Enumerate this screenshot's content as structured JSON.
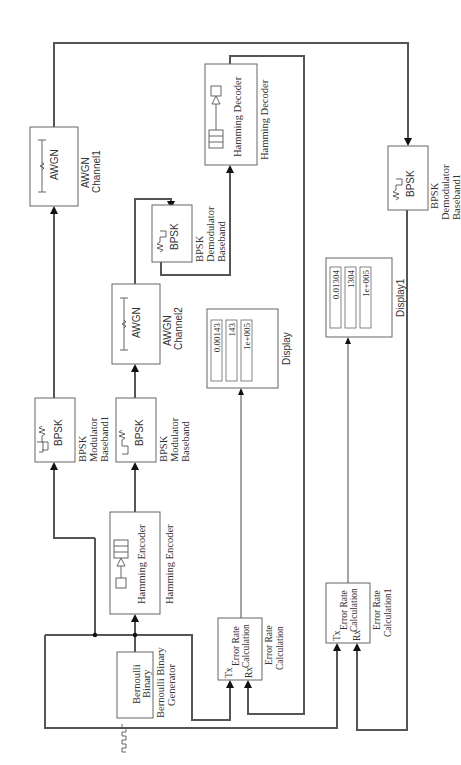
{
  "diagram": {
    "orientation": "rotated-90-ccw",
    "blocks": {
      "bernoulli": {
        "icon_text": "Bernoulli\nBinary",
        "icon_line1": "Bernoulli",
        "icon_line2": "Binary",
        "caption_line1": "Bernoulli Binary",
        "caption_line2": "Generator"
      },
      "hamming_encoder": {
        "icon_text": "Hamming Encoder",
        "caption": "Hamming Encoder"
      },
      "bpsk_mod": {
        "icon_text": "BPSK",
        "caption_line1": "BPSK",
        "caption_line2": "Modulator",
        "caption_line3": "Baseband"
      },
      "bpsk_mod1": {
        "icon_text": "BPSK",
        "caption_line1": "BPSK",
        "caption_line2": "Modulator",
        "caption_line3": "Baseband1"
      },
      "awgn_ch1": {
        "icon_text": "AWGN",
        "caption_line1": "AWGN",
        "caption_line2": "Channel1"
      },
      "awgn_ch2": {
        "icon_text": "AWGN",
        "caption_line1": "AWGN",
        "caption_line2": "Channel2"
      },
      "bpsk_demod": {
        "icon_text": "BPSK",
        "caption_line1": "BPSK",
        "caption_line2": "Demodulator",
        "caption_line3": "Baseband"
      },
      "bpsk_demod1": {
        "icon_text": "BPSK",
        "caption_line1": "BPSK",
        "caption_line2": "Demodulator",
        "caption_line3": "Baseband1"
      },
      "hamming_decoder": {
        "icon_text": "Hamming Decoder",
        "caption": "Hamming Decoder"
      },
      "error_rate": {
        "port_tx": "Tx",
        "port_rx": "Rx",
        "icon_line1": "Error Rate",
        "icon_line2": "Calculation",
        "caption_line1": "Error Rate",
        "caption_line2": "Calculation"
      },
      "error_rate1": {
        "port_tx": "Tx",
        "port_rx": "Rx",
        "icon_line1": "Error Rate",
        "icon_line2": "Calculation",
        "caption_line1": "Error Rate",
        "caption_line2": "Calculation1"
      },
      "display": {
        "values": [
          "0.00143",
          "143",
          "1e+005"
        ],
        "caption": "Display"
      },
      "display1": {
        "values": [
          "0.01304",
          "1304",
          "1e+005"
        ],
        "caption": "Display1"
      }
    },
    "colors": {
      "wire": "#555555",
      "block_border": "#666666",
      "background": "#ffffff"
    }
  }
}
